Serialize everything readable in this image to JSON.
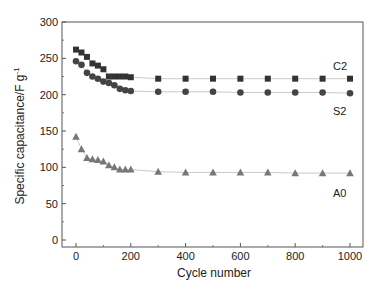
{
  "chart_data": {
    "type": "line",
    "title": "",
    "xlabel": "Cycle number",
    "ylabel": "Specific capacitance/F g⁻¹",
    "xlim": [
      -40,
      1050
    ],
    "ylim": [
      -10,
      300
    ],
    "xticks": [
      0,
      200,
      400,
      600,
      800,
      1000
    ],
    "yticks": [
      0,
      50,
      100,
      150,
      200,
      250,
      300
    ],
    "grid": false,
    "legend_position": "inline labels at right",
    "series": [
      {
        "name": "C2",
        "marker": "square",
        "color": "#333333",
        "x": [
          0,
          20,
          40,
          60,
          80,
          100,
          120,
          140,
          160,
          180,
          200,
          300,
          400,
          500,
          600,
          700,
          800,
          900,
          1000
        ],
        "values": [
          262,
          258,
          252,
          243,
          240,
          235,
          225,
          225,
          225,
          225,
          224,
          222,
          222,
          222,
          222,
          222,
          222,
          222,
          222
        ]
      },
      {
        "name": "S2",
        "marker": "circle",
        "color": "#444444",
        "x": [
          0,
          20,
          40,
          60,
          80,
          100,
          120,
          140,
          160,
          180,
          200,
          300,
          400,
          500,
          600,
          700,
          800,
          900,
          1000
        ],
        "values": [
          246,
          241,
          230,
          225,
          222,
          218,
          216,
          213,
          208,
          206,
          205,
          204,
          204,
          204,
          203,
          203,
          203,
          203,
          202
        ]
      },
      {
        "name": "A0",
        "marker": "triangle",
        "color": "#777777",
        "x": [
          0,
          20,
          40,
          60,
          80,
          100,
          120,
          140,
          160,
          180,
          200,
          300,
          400,
          500,
          600,
          700,
          800,
          900,
          1000
        ],
        "values": [
          142,
          125,
          113,
          111,
          110,
          108,
          103,
          100,
          97,
          97,
          97,
          94,
          93,
          93,
          93,
          93,
          92,
          92,
          92
        ]
      }
    ]
  },
  "labels": {
    "x_axis_title": "Cycle number",
    "y_axis_title": "Specific capacitance/F g",
    "y_axis_sup": "-1",
    "series_c2": "C2",
    "series_s2": "S2",
    "series_a0": "A0"
  }
}
